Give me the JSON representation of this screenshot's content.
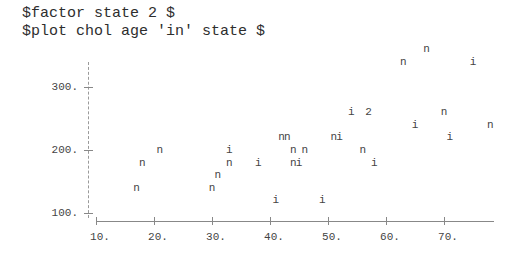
{
  "console": {
    "line1": "$factor state 2 $",
    "line2": "$plot chol age 'in' state $"
  },
  "chart_data": {
    "type": "scatter",
    "title": "",
    "xlabel": "age",
    "ylabel": "chol",
    "legend": {
      "i": "state = i",
      "n": "state = n",
      "2": "two points overlap"
    },
    "xlim": [
      10,
      78
    ],
    "ylim": [
      100,
      370
    ],
    "x_ticks": [
      "10.",
      "20.",
      "30.",
      "40.",
      "50.",
      "60.",
      "70."
    ],
    "y_ticks": [
      "100.",
      "200.",
      "300."
    ],
    "grid": false,
    "points": [
      {
        "x": 17,
        "y": 140,
        "s": "n"
      },
      {
        "x": 18,
        "y": 180,
        "s": "n"
      },
      {
        "x": 21,
        "y": 200,
        "s": "n"
      },
      {
        "x": 30,
        "y": 140,
        "s": "n"
      },
      {
        "x": 31,
        "y": 160,
        "s": "n"
      },
      {
        "x": 33,
        "y": 180,
        "s": "n"
      },
      {
        "x": 33,
        "y": 200,
        "s": "i"
      },
      {
        "x": 38,
        "y": 180,
        "s": "i"
      },
      {
        "x": 41,
        "y": 120,
        "s": "i"
      },
      {
        "x": 42,
        "y": 220,
        "s": "n"
      },
      {
        "x": 43,
        "y": 220,
        "s": "n"
      },
      {
        "x": 44,
        "y": 200,
        "s": "n"
      },
      {
        "x": 44,
        "y": 180,
        "s": "n"
      },
      {
        "x": 45,
        "y": 180,
        "s": "i"
      },
      {
        "x": 46,
        "y": 200,
        "s": "n"
      },
      {
        "x": 49,
        "y": 120,
        "s": "i"
      },
      {
        "x": 51,
        "y": 220,
        "s": "n"
      },
      {
        "x": 52,
        "y": 220,
        "s": "i"
      },
      {
        "x": 54,
        "y": 260,
        "s": "i"
      },
      {
        "x": 56,
        "y": 200,
        "s": "n"
      },
      {
        "x": 57,
        "y": 260,
        "s": "2"
      },
      {
        "x": 58,
        "y": 180,
        "s": "i"
      },
      {
        "x": 63,
        "y": 340,
        "s": "n"
      },
      {
        "x": 65,
        "y": 240,
        "s": "i"
      },
      {
        "x": 67,
        "y": 360,
        "s": "n"
      },
      {
        "x": 70,
        "y": 260,
        "s": "n"
      },
      {
        "x": 71,
        "y": 220,
        "s": "i"
      },
      {
        "x": 75,
        "y": 340,
        "s": "i"
      },
      {
        "x": 78,
        "y": 240,
        "s": "n"
      }
    ]
  }
}
